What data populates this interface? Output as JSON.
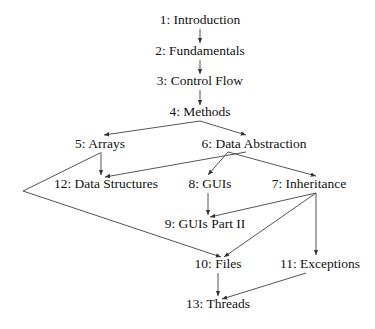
{
  "diagram": {
    "type": "dependency-graph",
    "colors": {
      "text": "#111111",
      "edge": "#555555",
      "background": "#ffffff"
    },
    "nodes": [
      {
        "id": "n1",
        "label": "1: Introduction",
        "x": 200,
        "y": 24
      },
      {
        "id": "n2",
        "label": "2: Fundamentals",
        "x": 200,
        "y": 55
      },
      {
        "id": "n3",
        "label": "3: Control Flow",
        "x": 200,
        "y": 85
      },
      {
        "id": "n4",
        "label": "4: Methods",
        "x": 200,
        "y": 116
      },
      {
        "id": "n5",
        "label": "5: Arrays",
        "x": 100,
        "y": 147
      },
      {
        "id": "n6",
        "label": "6: Data Abstraction",
        "x": 250,
        "y": 147
      },
      {
        "id": "n12",
        "label": "12: Data Structures",
        "x": 105,
        "y": 187
      },
      {
        "id": "n8",
        "label": "8: GUIs",
        "x": 210,
        "y": 187
      },
      {
        "id": "n7",
        "label": "7: Inheritance",
        "x": 308,
        "y": 187
      },
      {
        "id": "n9",
        "label": "9: GUIs Part II",
        "x": 205,
        "y": 227
      },
      {
        "id": "n10",
        "label": "10: Files",
        "x": 218,
        "y": 267
      },
      {
        "id": "n11",
        "label": "11: Exceptions",
        "x": 318,
        "y": 267
      },
      {
        "id": "n13",
        "label": "13: Threads",
        "x": 218,
        "y": 307
      }
    ],
    "edges": [
      {
        "from": "1: Introduction",
        "to": "2: Fundamentals"
      },
      {
        "from": "2: Fundamentals",
        "to": "3: Control Flow"
      },
      {
        "from": "3: Control Flow",
        "to": "4: Methods"
      },
      {
        "from": "4: Methods",
        "to": "5: Arrays"
      },
      {
        "from": "4: Methods",
        "to": "6: Data Abstraction"
      },
      {
        "from": "5: Arrays",
        "to": "12: Data Structures"
      },
      {
        "from": "6: Data Abstraction",
        "to": "12: Data Structures"
      },
      {
        "from": "6: Data Abstraction",
        "to": "8: GUIs"
      },
      {
        "from": "6: Data Abstraction",
        "to": "7: Inheritance"
      },
      {
        "from": "8: GUIs",
        "to": "9: GUIs Part II"
      },
      {
        "from": "7: Inheritance",
        "to": "9: GUIs Part II"
      },
      {
        "from": "7: Inheritance",
        "to": "10: Files"
      },
      {
        "from": "7: Inheritance",
        "to": "11: Exceptions"
      },
      {
        "from": "5: Arrays",
        "to": "10: Files",
        "routed_via_left": true
      },
      {
        "from": "10: Files",
        "to": "13: Threads"
      },
      {
        "from": "11: Exceptions",
        "to": "13: Threads"
      }
    ]
  }
}
